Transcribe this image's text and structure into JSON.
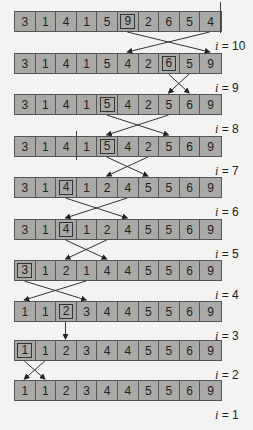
{
  "diagram": {
    "rows": [
      {
        "values": [
          3,
          1,
          4,
          1,
          5,
          9,
          2,
          6,
          5,
          4
        ],
        "highlight": 5,
        "label": "i = 10"
      },
      {
        "values": [
          3,
          1,
          4,
          1,
          5,
          4,
          2,
          6,
          5,
          9
        ],
        "highlight": 7,
        "label": "i = 9"
      },
      {
        "values": [
          3,
          1,
          4,
          1,
          5,
          4,
          2,
          5,
          6,
          9
        ],
        "highlight": 4,
        "label": "i = 8"
      },
      {
        "values": [
          3,
          1,
          4,
          1,
          5,
          4,
          2,
          5,
          6,
          9
        ],
        "highlight": 4,
        "label": "i = 7"
      },
      {
        "values": [
          3,
          1,
          4,
          1,
          2,
          4,
          5,
          5,
          6,
          9
        ],
        "highlight": 2,
        "label": "i = 6"
      },
      {
        "values": [
          3,
          1,
          4,
          1,
          2,
          4,
          5,
          5,
          6,
          9
        ],
        "highlight": 2,
        "label": "i = 5"
      },
      {
        "values": [
          3,
          1,
          2,
          1,
          4,
          4,
          5,
          5,
          6,
          9
        ],
        "highlight": 0,
        "label": "i = 4"
      },
      {
        "values": [
          1,
          1,
          2,
          3,
          4,
          4,
          5,
          5,
          6,
          9
        ],
        "highlight": 2,
        "label": "i = 3"
      },
      {
        "values": [
          1,
          1,
          2,
          3,
          4,
          4,
          5,
          5,
          6,
          9
        ],
        "highlight": 0,
        "label": "i = 2"
      },
      {
        "values": [
          1,
          1,
          2,
          3,
          4,
          4,
          5,
          5,
          6,
          9
        ],
        "highlight": -1,
        "label": "i = 1"
      }
    ],
    "swaps": [
      {
        "from_row": 0,
        "a": 9,
        "b": 5
      },
      {
        "from_row": 1,
        "a": 8,
        "b": 7
      },
      {
        "from_row": 2,
        "a": 7,
        "b": 4
      },
      {
        "from_row": 3,
        "a": 6,
        "b": 4
      },
      {
        "from_row": 4,
        "a": 5,
        "b": 2
      },
      {
        "from_row": 5,
        "a": 4,
        "b": 2
      },
      {
        "from_row": 6,
        "a": 3,
        "b": 0
      },
      {
        "from_row": 7,
        "a": 2,
        "b": 2
      },
      {
        "from_row": 8,
        "a": 1,
        "b": 0
      }
    ],
    "colors": {
      "cell": "#a9a9a7",
      "border": "#555555",
      "background": "#f3f3f1",
      "arrow": "#333333"
    }
  }
}
